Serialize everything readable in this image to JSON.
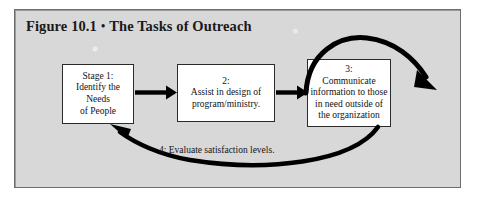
{
  "figure": {
    "title_label": "Figure 10.1",
    "title_separator": "•",
    "title_text": "The Tasks of Outreach",
    "frame_color": "#6d6d6d",
    "background_color": "#d8d8d8",
    "box_fill_color": "#ffffff",
    "ink_color": "#000000"
  },
  "stages": [
    {
      "id": "stage-1",
      "lines": [
        "Stage 1:",
        "Identify the Needs",
        "of People"
      ]
    },
    {
      "id": "stage-2",
      "lines": [
        "2:",
        "Assist in design of",
        "program/ministry."
      ]
    },
    {
      "id": "stage-3",
      "lines": [
        "3:",
        "Communicate",
        "information to those",
        "in need outside of",
        "the organization"
      ]
    }
  ],
  "feedback": {
    "caption": "4: Evaluate satisfaction levels."
  },
  "connectors": [
    {
      "name": "arrow-stage1-to-stage2",
      "type": "straight-arrow"
    },
    {
      "name": "arrow-stage2-to-stage3",
      "type": "straight-arrow"
    },
    {
      "name": "arrow-outreach-arc",
      "type": "curved-arrow"
    },
    {
      "name": "arrow-feedback-loop",
      "type": "curved-arrow"
    }
  ]
}
